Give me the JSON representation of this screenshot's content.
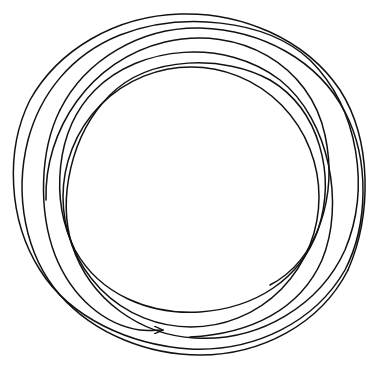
{
  "figure": {
    "type": "line-drawing",
    "stroke_color": "#111111",
    "background_color": "#ffffff",
    "start_point": [
      190,
      337
    ],
    "arrow_tip": [
      163,
      330
    ],
    "loops": 5
  }
}
